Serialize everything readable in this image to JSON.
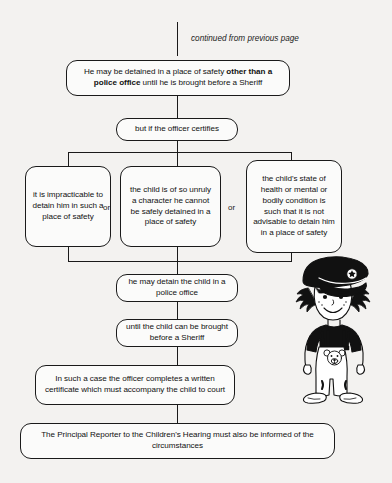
{
  "page": {
    "background_color": "#f3f2f0",
    "ink_color": "#1a1a1a",
    "caption": "continued from previous page"
  },
  "flowchart": {
    "type": "flowchart",
    "orientation": "top-to-bottom",
    "nodes": [
      {
        "id": "n1",
        "shape": "rounded-rectangle",
        "text_plain": "He may be detained in a place of safety other than a police office until he is brought before a Sheriff",
        "line1_pre": "He may be detained in a place of safety ",
        "line1_bold": "other than a",
        "line2_bold": "police office",
        "line2_post": " until he is brought before a Sheriff"
      },
      {
        "id": "n2",
        "shape": "rounded-rectangle",
        "text": "but if the officer certifies"
      },
      {
        "id": "n3a",
        "shape": "rounded-rectangle",
        "text": "it is impracticable to detain him in such a place of safety",
        "lines": [
          "it is impracticable",
          "to detain him",
          "in such a",
          "place of safety"
        ]
      },
      {
        "id": "n3b",
        "shape": "rounded-rectangle",
        "text": "the child is of so unruly a character he cannot be safely detained in a place of safety",
        "lines": [
          "the child is of so",
          "unruly a character",
          "he cannot be safely",
          "detained in a place",
          "of safety"
        ]
      },
      {
        "id": "n3c",
        "shape": "rounded-rectangle",
        "text": "the child's state of health or mental or bodily condition is such that it is not advisable to detain him in a place of safety",
        "lines": [
          "the child's state of",
          "health or mental or",
          "bodily condition is",
          "such that it is not",
          "advisable to detain",
          "him in a place of",
          "safety"
        ]
      },
      {
        "id": "n4",
        "shape": "rounded-rectangle",
        "text": "he may detain the child in a police office",
        "lines": [
          "he may detain the child in a",
          "police office"
        ]
      },
      {
        "id": "n5",
        "shape": "rounded-rectangle",
        "text": "until the child can be brought before a Sheriff",
        "lines": [
          "until the child can be brought",
          "before a Sheriff"
        ]
      },
      {
        "id": "n6",
        "shape": "rounded-rectangle",
        "text": "In such a case the officer completes a written certificate which must accompany the child to court",
        "lines": [
          "In such a case the officer completes a written",
          "certificate which must accompany the child to",
          "court"
        ]
      },
      {
        "id": "n7",
        "shape": "rounded-rectangle",
        "text": "The Principal Reporter to the Children's Hearing must also be informed of the circumstances",
        "lines": [
          "The Principal Reporter to the Children's Hearing must also be informed of",
          "the circumstances"
        ]
      }
    ],
    "branch_labels": [
      {
        "id": "or1",
        "text": "or"
      },
      {
        "id": "or2",
        "text": "or"
      }
    ]
  },
  "illustration": {
    "name": "child-in-police-cap",
    "description": "cartoon child wearing oversized police cap, pigtails, dark top, white dungarees with teddy-bear bib motif and large white shoes"
  }
}
